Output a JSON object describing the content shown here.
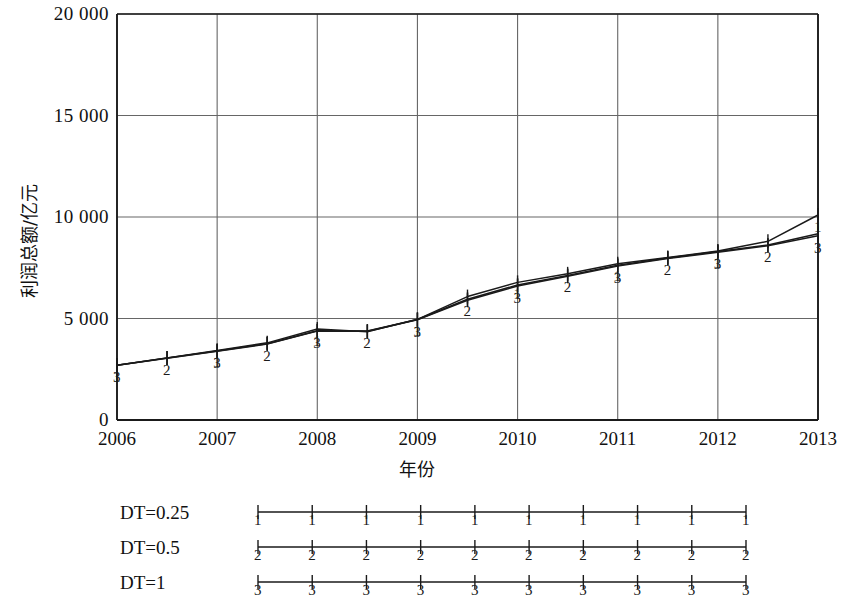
{
  "chart_data": {
    "type": "line",
    "title": "",
    "xlabel": "年份",
    "ylabel": "利润总额/亿元",
    "xlim": [
      2006,
      2013
    ],
    "ylim": [
      0,
      20000
    ],
    "xticks": [
      "2006",
      "2007",
      "2008",
      "2009",
      "2010",
      "2011",
      "2012",
      "2013"
    ],
    "yticks": [
      "0",
      "5 000",
      "10 000",
      "15 000",
      "20 000"
    ],
    "ytick_values": [
      0,
      5000,
      10000,
      15000,
      20000
    ],
    "grid": "both",
    "legend_position": "below",
    "x": [
      2006,
      2006.5,
      2007,
      2007.5,
      2008,
      2008.5,
      2009,
      2009.5,
      2010,
      2010.5,
      2011,
      2011.5,
      2012,
      2012.5,
      2013
    ],
    "series": [
      {
        "name": "DT=0.25",
        "marker": "1",
        "color": "#1a1a1a",
        "values": [
          2700,
          3060,
          3430,
          3800,
          4480,
          4350,
          4960,
          6080,
          6780,
          7200,
          7700,
          8000,
          8330,
          8800,
          10100
        ]
      },
      {
        "name": "DT=0.5",
        "marker": "2",
        "color": "#1a1a1a",
        "values": [
          2700,
          3050,
          3400,
          3760,
          4400,
          4380,
          4950,
          5950,
          6650,
          7120,
          7620,
          7980,
          8300,
          8620,
          9180
        ]
      },
      {
        "name": "DT=1",
        "marker": "3",
        "color": "#1a1a1a",
        "values": [
          2700,
          3040,
          3390,
          3740,
          4380,
          4370,
          4940,
          5900,
          6600,
          7080,
          7580,
          7950,
          8260,
          8580,
          9080
        ]
      }
    ]
  },
  "legend": {
    "entries": [
      {
        "label": "DT=0.25",
        "marker": "1"
      },
      {
        "label": "DT=0.5",
        "marker": "2"
      },
      {
        "label": "DT=1",
        "marker": "3"
      }
    ],
    "sample_marker_count": 10
  },
  "colors": {
    "line": "#1a1a1a",
    "grid": "#666666",
    "axis": "#1a1a1a",
    "background": "#ffffff"
  }
}
